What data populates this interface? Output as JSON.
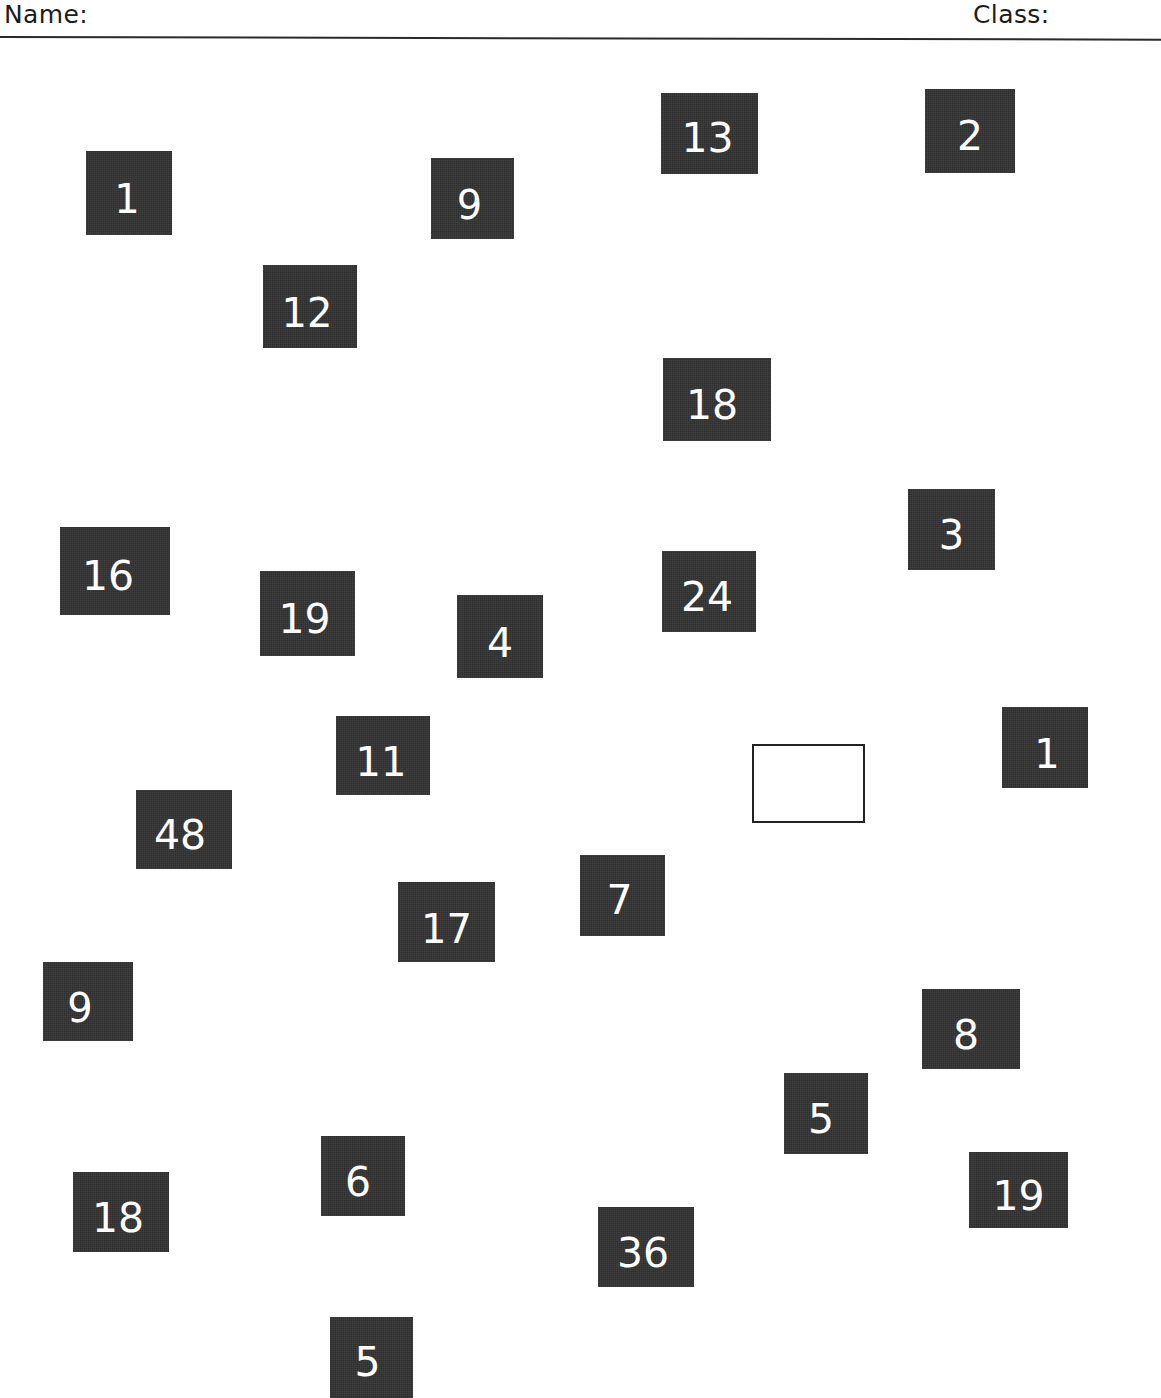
{
  "header": {
    "name_label": "Name:",
    "class_label": "Class:"
  },
  "colors": {
    "tile_fill": "#2e2e2e",
    "tile_text": "#ffffff",
    "page_background": "#ffffff",
    "rule": "#2a2a2a",
    "empty_box_border": "#232323"
  },
  "tiles": [
    {
      "value": "1",
      "x": 86,
      "y": 151,
      "w": 86,
      "h": 84,
      "font": 40,
      "nudge_x": -2,
      "nudge_y": 6
    },
    {
      "value": "13",
      "x": 661,
      "y": 93,
      "w": 97,
      "h": 81,
      "font": 41,
      "nudge_x": -2,
      "nudge_y": 5
    },
    {
      "value": "2",
      "x": 925,
      "y": 89,
      "w": 90,
      "h": 84,
      "font": 41,
      "nudge_x": 0,
      "nudge_y": 5
    },
    {
      "value": "9",
      "x": 431,
      "y": 158,
      "w": 83,
      "h": 81,
      "font": 40,
      "nudge_x": -3,
      "nudge_y": 6
    },
    {
      "value": "12",
      "x": 263,
      "y": 265,
      "w": 94,
      "h": 83,
      "font": 40,
      "nudge_x": -3,
      "nudge_y": 6
    },
    {
      "value": "18",
      "x": 663,
      "y": 358,
      "w": 108,
      "h": 83,
      "font": 41,
      "nudge_x": -5,
      "nudge_y": 6
    },
    {
      "value": "3",
      "x": 908,
      "y": 489,
      "w": 87,
      "h": 81,
      "font": 40,
      "nudge_x": 0,
      "nudge_y": 5
    },
    {
      "value": "16",
      "x": 60,
      "y": 527,
      "w": 110,
      "h": 88,
      "font": 41,
      "nudge_x": -7,
      "nudge_y": 5
    },
    {
      "value": "24",
      "x": 662,
      "y": 551,
      "w": 94,
      "h": 81,
      "font": 41,
      "nudge_x": -2,
      "nudge_y": 6
    },
    {
      "value": "19",
      "x": 260,
      "y": 571,
      "w": 95,
      "h": 85,
      "font": 41,
      "nudge_x": -3,
      "nudge_y": 6
    },
    {
      "value": "4",
      "x": 457,
      "y": 595,
      "w": 86,
      "h": 83,
      "font": 41,
      "nudge_x": 0,
      "nudge_y": 7
    },
    {
      "value": "1",
      "x": 1002,
      "y": 707,
      "w": 86,
      "h": 81,
      "font": 40,
      "nudge_x": 2,
      "nudge_y": 6
    },
    {
      "value": "11",
      "x": 336,
      "y": 716,
      "w": 94,
      "h": 79,
      "font": 40,
      "nudge_x": -2,
      "nudge_y": 6
    },
    {
      "value": "48",
      "x": 136,
      "y": 790,
      "w": 96,
      "h": 79,
      "font": 41,
      "nudge_x": -4,
      "nudge_y": 6
    },
    {
      "value": "7",
      "x": 580,
      "y": 855,
      "w": 85,
      "h": 81,
      "font": 41,
      "nudge_x": -3,
      "nudge_y": 5
    },
    {
      "value": "17",
      "x": 398,
      "y": 882,
      "w": 97,
      "h": 80,
      "font": 40,
      "nudge_x": 0,
      "nudge_y": 7
    },
    {
      "value": "9",
      "x": 43,
      "y": 962,
      "w": 90,
      "h": 79,
      "font": 40,
      "nudge_x": -8,
      "nudge_y": 6
    },
    {
      "value": "8",
      "x": 922,
      "y": 989,
      "w": 98,
      "h": 80,
      "font": 41,
      "nudge_x": -5,
      "nudge_y": 6
    },
    {
      "value": "5",
      "x": 784,
      "y": 1073,
      "w": 84,
      "h": 81,
      "font": 41,
      "nudge_x": -5,
      "nudge_y": 6
    },
    {
      "value": "6",
      "x": 321,
      "y": 1136,
      "w": 84,
      "h": 80,
      "font": 41,
      "nudge_x": -5,
      "nudge_y": 6
    },
    {
      "value": "19",
      "x": 969,
      "y": 1152,
      "w": 99,
      "h": 76,
      "font": 41,
      "nudge_x": 0,
      "nudge_y": 6
    },
    {
      "value": "18",
      "x": 73,
      "y": 1172,
      "w": 96,
      "h": 80,
      "font": 41,
      "nudge_x": -3,
      "nudge_y": 6
    },
    {
      "value": "36",
      "x": 598,
      "y": 1207,
      "w": 96,
      "h": 80,
      "font": 41,
      "nudge_x": -3,
      "nudge_y": 6
    },
    {
      "value": "5",
      "x": 330,
      "y": 1317,
      "w": 83,
      "h": 81,
      "font": 41,
      "nudge_x": -4,
      "nudge_y": 5
    }
  ],
  "empty_box": {
    "x": 752,
    "y": 744,
    "w": 113,
    "h": 79,
    "value": ""
  }
}
